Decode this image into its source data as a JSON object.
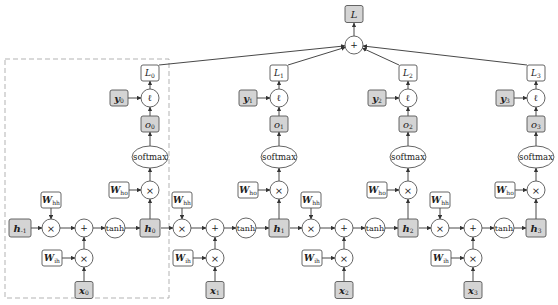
{
  "diagram": {
    "total_loss": {
      "label": "L",
      "node": "box",
      "fill": "gray"
    },
    "sum_op": "+",
    "ops": {
      "mul": "×",
      "add": "+",
      "tanh": "tanh",
      "softmax": "softmax",
      "loss_fn": "ℓ"
    },
    "weights": {
      "hh": "W",
      "hh_sub": "hh",
      "ih": "W",
      "ih_sub": "ih",
      "ho": "W",
      "ho_sub": "ho"
    },
    "initial_state": {
      "label": "h",
      "sub": "-1"
    },
    "steps": [
      {
        "t": 0,
        "h": "h",
        "h_sub": "0",
        "x": "x",
        "x_sub": "0",
        "o": "o",
        "o_sub": "0",
        "y": "y",
        "y_sub": "0",
        "L": "L",
        "L_sub": "0"
      },
      {
        "t": 1,
        "h": "h",
        "h_sub": "1",
        "x": "x",
        "x_sub": "1",
        "o": "o",
        "o_sub": "1",
        "y": "y",
        "y_sub": "1",
        "L": "L",
        "L_sub": "1"
      },
      {
        "t": 2,
        "h": "h",
        "h_sub": "2",
        "x": "x",
        "x_sub": "2",
        "o": "o",
        "o_sub": "2",
        "y": "y",
        "y_sub": "2",
        "L": "L",
        "L_sub": "2"
      },
      {
        "t": 3,
        "h": "h",
        "h_sub": "3",
        "x": "x",
        "x_sub": "3",
        "o": "o",
        "o_sub": "3",
        "y": "y",
        "y_sub": "3",
        "L": "L",
        "L_sub": "3"
      }
    ],
    "highlight": "dashed box around time step 0",
    "colors": {
      "gray_node": "#d4d4d4",
      "white_node": "#ffffff",
      "stroke": "#555555",
      "dashed": "#aaaaaa"
    }
  }
}
